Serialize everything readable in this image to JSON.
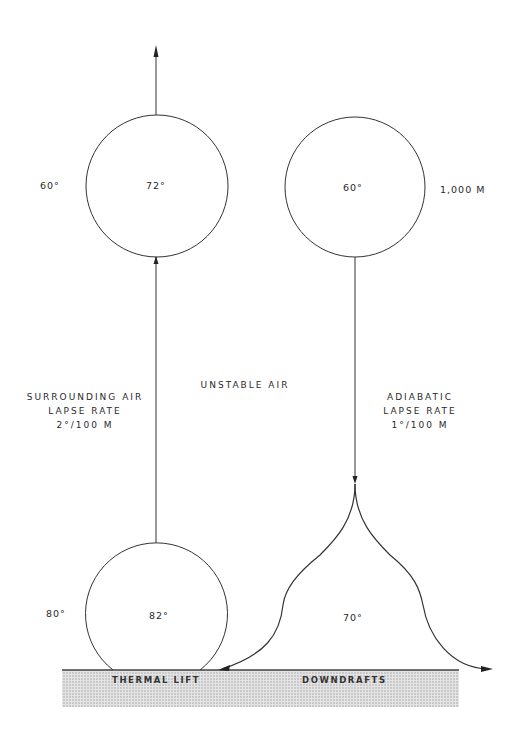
{
  "diagram": {
    "labels": {
      "altitude": "1,000 M",
      "surrounding_air_top": "60°",
      "rising_parcel_top": "72°",
      "descending_parcel_top": "60°",
      "surrounding_air_bottom": "80°",
      "rising_parcel_bottom": "82°",
      "downdraft_temp": "70°",
      "center_label": "UNSTABLE   AIR",
      "left_note": [
        "SURROUNDING AIR",
        "LAPSE RATE",
        "2°/100 M"
      ],
      "right_note": [
        "ADIABATIC",
        "LAPSE RATE",
        "1°/100 M"
      ],
      "ground_left": "THERMAL LIFT",
      "ground_right": "DOWNDRAFTS"
    },
    "colors": {
      "line": "#333333",
      "ground_fill": "#d6d6d6",
      "background": "#ffffff"
    }
  }
}
